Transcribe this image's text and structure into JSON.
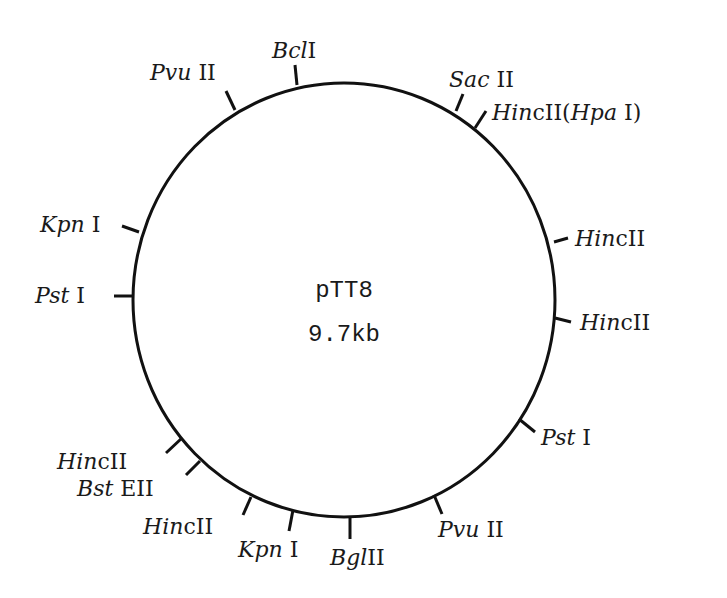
{
  "plasmid": {
    "name": "pTT8",
    "size": "9.7kb"
  },
  "colors": {
    "line": "#111111",
    "text": "#1a1a1a",
    "background": "#ffffff"
  },
  "sites": [
    {
      "enzyme_italic": "Bcl",
      "enzyme_suffix": "I"
    },
    {
      "enzyme_italic": "Sac",
      "enzyme_suffix": " II"
    },
    {
      "enzyme_italic": "Hin",
      "enzyme_suffix": "cII(",
      "extra_italic": "Hpa",
      "extra_suffix": " I)"
    },
    {
      "enzyme_italic": "Hin",
      "enzyme_suffix": "cII"
    },
    {
      "enzyme_italic": "Hin",
      "enzyme_suffix": "cII"
    },
    {
      "enzyme_italic": "Pst",
      "enzyme_suffix": " I"
    },
    {
      "enzyme_italic": "Pvu",
      "enzyme_suffix": " II"
    },
    {
      "enzyme_italic": "Bgl",
      "enzyme_suffix": "II"
    },
    {
      "enzyme_italic": "Kpn",
      "enzyme_suffix": " I"
    },
    {
      "enzyme_italic": "Hin",
      "enzyme_suffix": "cII"
    },
    {
      "enzyme_italic": "Bst",
      "enzyme_suffix": " EII"
    },
    {
      "enzyme_italic": "Hin",
      "enzyme_suffix": "cII"
    },
    {
      "enzyme_italic": "Pst",
      "enzyme_suffix": " I"
    },
    {
      "enzyme_italic": "Kpn",
      "enzyme_suffix": " I"
    },
    {
      "enzyme_italic": "Pvu",
      "enzyme_suffix": " II"
    }
  ]
}
